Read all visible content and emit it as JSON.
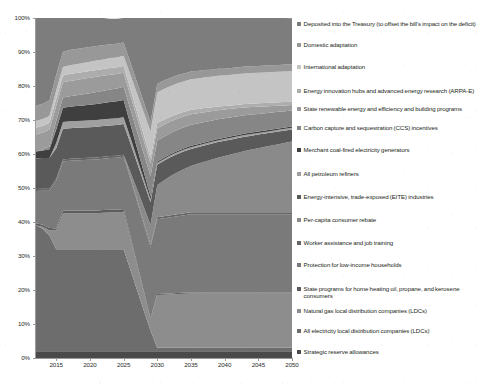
{
  "chart_data": {
    "type": "area",
    "title": "",
    "subtitle": "",
    "xlabel": "",
    "ylabel": "",
    "stacked": true,
    "normalized_percent": true,
    "grid": false,
    "legend_position": "right",
    "xlim": [
      2012,
      2050
    ],
    "ylim": [
      0,
      100
    ],
    "x": [
      2012,
      2013,
      2014,
      2015,
      2016,
      2017,
      2018,
      2019,
      2020,
      2021,
      2022,
      2023,
      2024,
      2025,
      2026,
      2027,
      2028,
      2029,
      2030,
      2031,
      2032,
      2033,
      2034,
      2035,
      2036,
      2037,
      2038,
      2039,
      2040,
      2041,
      2042,
      2043,
      2044,
      2045,
      2046,
      2047,
      2048,
      2049,
      2050
    ],
    "ytick_labels": [
      "0%",
      "10%",
      "20%",
      "30%",
      "40%",
      "50%",
      "60%",
      "70%",
      "80%",
      "90%",
      "100%"
    ],
    "ytick_values": [
      0,
      10,
      20,
      30,
      40,
      50,
      60,
      70,
      80,
      90,
      100
    ],
    "xtick_labels": [
      "2015",
      "2020",
      "2025",
      "2030",
      "2035",
      "2040",
      "2045",
      "2050"
    ],
    "xtick_values": [
      2015,
      2020,
      2025,
      2030,
      2035,
      2040,
      2045,
      2050
    ],
    "series": [
      {
        "name": "Strategic reserve allowances",
        "color": "#4a4a4a",
        "values": [
          2.0,
          2.0,
          2.0,
          2.0,
          2.0,
          2.0,
          2.0,
          2.0,
          2.0,
          2.0,
          2.0,
          2.0,
          2.0,
          2.0,
          2.0,
          2.0,
          2.0,
          2.0,
          2.0,
          2.0,
          2.0,
          2.0,
          2.0,
          2.0,
          2.0,
          2.0,
          2.0,
          2.0,
          2.0,
          2.0,
          2.0,
          2.0,
          2.0,
          2.0,
          2.0,
          2.0,
          2.0,
          2.0,
          2.0
        ]
      },
      {
        "name": "All electricity local distribution companies (LDCs)",
        "color": "#6d6d6d",
        "values": [
          37.0,
          36.0,
          34.0,
          30.0,
          30.0,
          30.0,
          30.0,
          30.0,
          30.0,
          30.0,
          30.0,
          30.0,
          30.0,
          30.0,
          24.0,
          18.0,
          12.0,
          6.0,
          1.0,
          1.0,
          1.0,
          1.0,
          1.0,
          1.0,
          1.0,
          1.0,
          1.0,
          1.0,
          1.0,
          1.0,
          1.0,
          1.0,
          1.0,
          1.0,
          1.0,
          1.0,
          1.0,
          1.0,
          1.0
        ]
      },
      {
        "name": "Natural gas local distribution companies (LDCs)",
        "color": "#8d8d8d",
        "values": [
          0.0,
          0.6,
          1.6,
          5.5,
          10.5,
          10.6,
          10.6,
          10.6,
          10.6,
          10.6,
          10.7,
          10.8,
          10.8,
          11.0,
          9.2,
          7.2,
          5.2,
          3.2,
          15.5,
          15.6,
          15.7,
          15.8,
          15.9,
          16.0,
          16.0,
          16.0,
          16.0,
          16.0,
          16.0,
          16.0,
          16.0,
          16.0,
          16.0,
          16.0,
          16.0,
          16.0,
          16.0,
          16.0,
          16.0
        ]
      },
      {
        "name": "State programs for home heating oil, propane, and kerosene consumers",
        "color": "#5c5c5c",
        "values": [
          0.6,
          0.6,
          0.6,
          0.6,
          0.8,
          0.8,
          0.8,
          0.8,
          0.8,
          0.8,
          0.8,
          0.8,
          0.8,
          0.8,
          0.7,
          0.6,
          0.5,
          0.4,
          0.3,
          0.3,
          0.3,
          0.3,
          0.3,
          0.3,
          0.3,
          0.3,
          0.3,
          0.3,
          0.3,
          0.3,
          0.3,
          0.3,
          0.3,
          0.3,
          0.3,
          0.3,
          0.3,
          0.3,
          0.3
        ]
      },
      {
        "name": "Protection for low-income households",
        "color": "#7a7a7a",
        "values": [
          9.5,
          10.0,
          11.0,
          14.0,
          14.5,
          14.6,
          14.7,
          14.8,
          14.9,
          15.0,
          15.1,
          15.2,
          15.3,
          15.4,
          16.8,
          18.2,
          19.6,
          21.0,
          22.0,
          22.2,
          22.4,
          22.6,
          22.8,
          23.0,
          23.0,
          23.0,
          23.0,
          23.0,
          23.0,
          23.0,
          23.0,
          23.0,
          23.0,
          23.0,
          23.0,
          23.0,
          23.0,
          23.0,
          23.0
        ]
      },
      {
        "name": "Worker assistance and job training",
        "color": "#666666",
        "values": [
          0.6,
          0.6,
          0.6,
          0.6,
          0.6,
          0.6,
          0.6,
          0.6,
          0.6,
          0.6,
          0.6,
          0.6,
          0.6,
          0.6,
          0.6,
          0.6,
          0.6,
          0.6,
          0.6,
          0.6,
          0.6,
          0.6,
          0.6,
          0.6,
          0.6,
          0.6,
          0.6,
          0.6,
          0.6,
          0.6,
          0.6,
          0.6,
          0.6,
          0.6,
          0.6,
          0.6,
          0.6,
          0.6,
          0.6
        ]
      },
      {
        "name": "Per-capita consumer rebate",
        "color": "#8a8a8a",
        "values": [
          0.0,
          0.0,
          0.0,
          0.0,
          0.0,
          0.0,
          0.0,
          0.0,
          0.0,
          0.0,
          0.0,
          0.0,
          0.0,
          0.0,
          1.5,
          3.0,
          4.5,
          6.0,
          9.5,
          10.5,
          11.5,
          12.3,
          13.0,
          13.6,
          14.2,
          14.8,
          15.4,
          16.0,
          16.5,
          17.0,
          17.5,
          18.0,
          18.4,
          18.8,
          19.2,
          19.6,
          20.0,
          20.4,
          20.8
        ]
      },
      {
        "name": "Energy-intensive, trade-exposed (EITE) industries",
        "color": "#5a5a5a",
        "values": [
          9.0,
          9.0,
          9.0,
          9.0,
          9.0,
          9.0,
          9.0,
          9.0,
          9.0,
          9.0,
          9.0,
          9.0,
          9.0,
          9.0,
          8.4,
          7.8,
          7.2,
          6.6,
          6.0,
          5.8,
          5.6,
          5.4,
          5.2,
          5.0,
          4.9,
          4.8,
          4.7,
          4.6,
          4.5,
          4.4,
          4.3,
          4.2,
          4.1,
          4.0,
          3.9,
          3.8,
          3.7,
          3.6,
          3.5
        ]
      },
      {
        "name": "All petroleum refiners",
        "color": "#a0a0a0",
        "values": [
          0.0,
          0.0,
          0.0,
          1.5,
          2.0,
          2.0,
          2.0,
          2.0,
          2.0,
          2.0,
          2.0,
          2.0,
          2.0,
          2.0,
          1.7,
          1.4,
          1.1,
          0.8,
          0.5,
          0.5,
          0.5,
          0.5,
          0.5,
          0.5,
          0.5,
          0.5,
          0.5,
          0.5,
          0.5,
          0.5,
          0.5,
          0.5,
          0.5,
          0.5,
          0.5,
          0.5,
          0.5,
          0.5,
          0.5
        ]
      },
      {
        "name": "Merchant coal-fired electricity generators",
        "color": "#3f3f3f",
        "values": [
          2.0,
          2.2,
          2.6,
          4.0,
          4.2,
          4.3,
          4.4,
          4.5,
          4.6,
          4.7,
          4.8,
          4.9,
          5.0,
          5.1,
          4.0,
          3.0,
          2.0,
          1.0,
          0.4,
          0.4,
          0.4,
          0.4,
          0.4,
          0.4,
          0.4,
          0.4,
          0.4,
          0.4,
          0.4,
          0.4,
          0.4,
          0.4,
          0.4,
          0.4,
          0.4,
          0.4,
          0.4,
          0.4,
          0.4
        ]
      },
      {
        "name": "Carbon capture and sequestration (CCS) incentives",
        "color": "#868686",
        "values": [
          0.0,
          0.3,
          0.8,
          2.5,
          3.0,
          3.1,
          3.2,
          3.3,
          3.4,
          3.5,
          3.6,
          3.7,
          3.8,
          3.9,
          4.4,
          4.9,
          5.4,
          5.9,
          6.2,
          6.2,
          6.2,
          6.2,
          6.2,
          6.2,
          6.1,
          6.0,
          5.9,
          5.8,
          5.7,
          5.6,
          5.5,
          5.4,
          5.3,
          5.2,
          5.1,
          5.0,
          4.9,
          4.8,
          4.7
        ]
      },
      {
        "name": "State renewable energy and efficiency and building programs",
        "color": "#9b9b9b",
        "values": [
          5.0,
          5.0,
          5.0,
          4.5,
          4.5,
          4.5,
          4.5,
          4.5,
          4.5,
          4.5,
          4.4,
          4.3,
          4.2,
          4.1,
          4.0,
          3.9,
          3.8,
          3.7,
          3.6,
          3.5,
          3.4,
          3.3,
          3.2,
          3.1,
          3.0,
          2.9,
          2.8,
          2.7,
          2.6,
          2.5,
          2.4,
          2.3,
          2.2,
          2.1,
          2.0,
          1.9,
          1.8,
          1.7,
          1.6
        ]
      },
      {
        "name": "Energy innovation hubs and advanced energy research (ARPA-E)",
        "color": "#adadad",
        "values": [
          2.0,
          2.0,
          2.0,
          2.0,
          2.0,
          2.0,
          2.0,
          2.0,
          2.0,
          2.0,
          2.0,
          2.0,
          2.0,
          2.0,
          1.9,
          1.8,
          1.7,
          1.6,
          1.5,
          1.5,
          1.4,
          1.4,
          1.3,
          1.3,
          1.2,
          1.2,
          1.1,
          1.1,
          1.0,
          1.0,
          1.0,
          1.0,
          1.0,
          1.0,
          1.0,
          1.0,
          1.0,
          1.0,
          1.0
        ]
      },
      {
        "name": "International adaptation",
        "color": "#c4c4c4",
        "values": [
          2.0,
          2.0,
          2.0,
          2.5,
          2.5,
          2.6,
          2.6,
          2.7,
          2.7,
          2.8,
          2.8,
          2.9,
          2.9,
          3.0,
          4.2,
          5.4,
          6.6,
          7.8,
          9.0,
          9.0,
          9.0,
          9.0,
          9.0,
          9.0,
          9.0,
          9.0,
          9.0,
          9.0,
          9.0,
          9.0,
          9.0,
          9.0,
          9.0,
          9.0,
          9.0,
          9.0,
          9.0,
          9.0,
          9.0
        ]
      },
      {
        "name": "Domestic adaptation",
        "color": "#989898",
        "values": [
          4.5,
          4.5,
          4.5,
          4.5,
          4.5,
          4.5,
          4.5,
          4.4,
          4.4,
          4.3,
          4.2,
          4.1,
          4.0,
          3.9,
          3.6,
          3.3,
          3.0,
          2.7,
          2.5,
          2.5,
          2.4,
          2.4,
          2.3,
          2.3,
          2.2,
          2.2,
          2.1,
          2.1,
          2.0,
          2.0,
          2.0,
          2.0,
          2.0,
          2.0,
          2.0,
          2.0,
          2.0,
          2.0,
          2.0
        ]
      },
      {
        "name": "Deposited into the Treasury (to offset the bill's impact on the deficit)",
        "color": "#7d7d7d",
        "values": [
          26.8,
          25.2,
          24.3,
          16.8,
          9.9,
          9.4,
          9.1,
          8.8,
          8.5,
          8.2,
          8.0,
          7.5,
          7.4,
          7.2,
          13.0,
          18.9,
          24.8,
          30.7,
          21.9,
          20.9,
          19.9,
          19.1,
          18.4,
          17.6,
          17.2,
          16.9,
          16.5,
          16.2,
          15.9,
          15.6,
          15.3,
          15.0,
          14.7,
          14.5,
          14.3,
          14.1,
          13.9,
          13.7,
          13.5
        ]
      }
    ],
    "legend_entries": [
      "Deposited into the Treasury (to offset the bill's impact on the deficit)",
      "Domestic adaptation",
      "International adaptation",
      "Energy innovation hubs and advanced energy research (ARPA-E)",
      "State renewable energy and efficiency and building programs",
      "Carbon capture and sequestration (CCS) incentives",
      "Merchant coal-fired electricity generators",
      "All petroleum refiners",
      "Energy-intensive, trade-exposed (EITE) industries",
      "Per-capita consumer rebate",
      "Worker assistance and job training",
      "Protection for low-income households",
      "State programs for home heating oil, propane, and kerosene consumers",
      "Natural gas local distribution companies (LDCs)",
      "All electricity local distribution companies (LDCs)",
      "Strategic reserve allowances"
    ],
    "legend_colors": [
      "#7d7d7d",
      "#989898",
      "#c4c4c4",
      "#adadad",
      "#9b9b9b",
      "#868686",
      "#3f3f3f",
      "#a0a0a0",
      "#5a5a5a",
      "#8a8a8a",
      "#666666",
      "#7a7a7a",
      "#5c5c5c",
      "#8d8d8d",
      "#6d6d6d",
      "#4a4a4a"
    ],
    "legend_item_tops": [
      20,
      41,
      63,
      87,
      105,
      124,
      146,
      170,
      193,
      216,
      239,
      261,
      285,
      307,
      327,
      348
    ]
  }
}
